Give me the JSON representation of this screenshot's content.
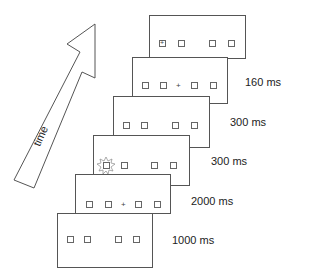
{
  "arrow": {
    "label": "time"
  },
  "frames": [
    {
      "id": "frame-1",
      "duration": "1000 ms",
      "content": "placeholders"
    },
    {
      "id": "frame-2",
      "duration": "2000 ms",
      "content": "placeholders-with-fixation"
    },
    {
      "id": "frame-3",
      "duration": "300 ms",
      "content": "cue-flash-left"
    },
    {
      "id": "frame-4",
      "duration": "300 ms",
      "content": "placeholders"
    },
    {
      "id": "frame-5",
      "duration": "160 ms",
      "content": "placeholders-with-fixation"
    },
    {
      "id": "frame-6",
      "duration": "",
      "content": "target-plus-in-left-box"
    }
  ],
  "symbols": {
    "fixation": "+",
    "target": "+"
  }
}
